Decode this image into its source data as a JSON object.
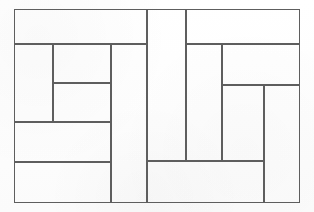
{
  "document": {
    "title": "Rectangle dissection figure",
    "kind": "scanned line drawing",
    "watermark_top": "",
    "watermark_mid": ""
  },
  "colors": {
    "paper": "#fefefe",
    "line": "#5e5e5e",
    "frame": "#3d3d3d",
    "watermark": "#000000"
  },
  "figure": {
    "label": "squared-rectangle-dissection",
    "frame": {
      "x": 14,
      "y": 9,
      "w": 286,
      "h": 194
    },
    "cells": [
      {
        "name": "cell-top-left-band",
        "x": 14,
        "y": 9,
        "w": 133,
        "h": 35,
        "label": ""
      },
      {
        "name": "cell-top-center-tall",
        "x": 147,
        "y": 9,
        "w": 39,
        "h": 152,
        "label": ""
      },
      {
        "name": "cell-top-right-band",
        "x": 186,
        "y": 9,
        "w": 114,
        "h": 35,
        "label": ""
      },
      {
        "name": "cell-left-upper-narrow",
        "x": 14,
        "y": 44,
        "w": 39,
        "h": 78,
        "label": ""
      },
      {
        "name": "cell-left-mid-tall",
        "x": 53,
        "y": 44,
        "w": 58,
        "h": 78,
        "label": ""
      },
      {
        "name": "cell-left-inner-upper",
        "x": 53,
        "y": 44,
        "w": 58,
        "h": 39,
        "label": ""
      },
      {
        "name": "cell-left-inner-lower",
        "x": 53,
        "y": 83,
        "w": 58,
        "h": 39,
        "label": ""
      },
      {
        "name": "cell-left-band-middle",
        "x": 14,
        "y": 122,
        "w": 97,
        "h": 40,
        "label": ""
      },
      {
        "name": "cell-left-band-bottom",
        "x": 14,
        "y": 162,
        "w": 97,
        "h": 41,
        "label": ""
      },
      {
        "name": "cell-left-column-right",
        "x": 111,
        "y": 44,
        "w": 36,
        "h": 159,
        "label": ""
      },
      {
        "name": "cell-center-lower-wide",
        "x": 147,
        "y": 161,
        "w": 117,
        "h": 42,
        "label": ""
      },
      {
        "name": "cell-center-right-tall",
        "x": 186,
        "y": 44,
        "w": 36,
        "h": 117,
        "label": ""
      },
      {
        "name": "cell-right-upper-band",
        "x": 222,
        "y": 44,
        "w": 78,
        "h": 41,
        "label": ""
      },
      {
        "name": "cell-right-mid-tall",
        "x": 222,
        "y": 85,
        "w": 42,
        "h": 76,
        "label": ""
      },
      {
        "name": "cell-right-far-tall",
        "x": 264,
        "y": 85,
        "w": 36,
        "h": 118,
        "label": ""
      }
    ]
  }
}
